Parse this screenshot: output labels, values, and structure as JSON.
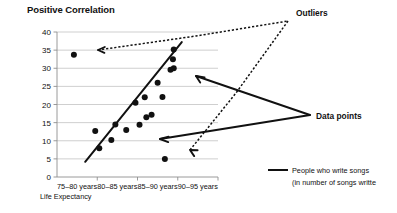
{
  "chart_data": {
    "type": "scatter",
    "title": "Positive Correlation",
    "xlabel": "Life Expectancy",
    "ylabel": "",
    "ylim": [
      0,
      40
    ],
    "ytick_step": 5,
    "yticks": [
      "0",
      "5",
      "10",
      "15",
      "20",
      "25",
      "30",
      "35",
      "40"
    ],
    "grid": true,
    "categories": [
      "75–80 years",
      "80–85 years",
      "85–90 years",
      "90–95 years"
    ],
    "points": [
      {
        "x": 1.05,
        "y": 7.9
      },
      {
        "x": 0.95,
        "y": 12.7
      },
      {
        "x": 1.35,
        "y": 10.2
      },
      {
        "x": 1.45,
        "y": 14.5
      },
      {
        "x": 1.72,
        "y": 13.0
      },
      {
        "x": 1.95,
        "y": 20.5
      },
      {
        "x": 2.05,
        "y": 14.4
      },
      {
        "x": 2.18,
        "y": 22.0
      },
      {
        "x": 2.22,
        "y": 16.5
      },
      {
        "x": 2.35,
        "y": 17.2
      },
      {
        "x": 2.5,
        "y": 26.0
      },
      {
        "x": 2.62,
        "y": 22.1
      },
      {
        "x": 2.9,
        "y": 35.2
      },
      {
        "x": 2.88,
        "y": 32.5
      },
      {
        "x": 2.9,
        "y": 30.0
      },
      {
        "x": 2.82,
        "y": 29.6
      }
    ],
    "outliers": [
      {
        "x": 0.42,
        "y": 33.7
      },
      {
        "x": 2.68,
        "y": 5.0
      }
    ],
    "trendline": {
      "x0": 0.7,
      "y0": 4.2,
      "x1": 3.1,
      "y1": 37.2
    },
    "annotations": [
      {
        "label": "Outliers",
        "style": "dotted"
      },
      {
        "label": "Data points",
        "style": "solid"
      }
    ],
    "legend": {
      "position": "bottom-right",
      "entries": [
        {
          "label": "People who write songs",
          "marker": "line"
        }
      ],
      "sublabel": "(in number of songs writte"
    },
    "colors": {
      "marker": "#111111",
      "trend": "#111111",
      "grid": "#c9c9c9",
      "axis": "#8f8f8f",
      "background": "#ffffff"
    }
  }
}
